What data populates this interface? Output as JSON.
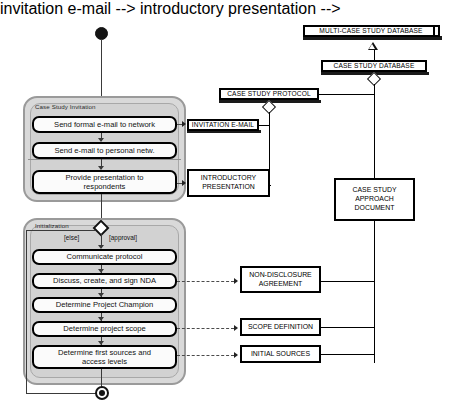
{
  "diagram": {
    "type": "uml-activity-diagram"
  },
  "control_nodes": {
    "start_label": "initial-node",
    "final_label": "activity-final-node",
    "decision_label": "decision-node"
  },
  "partitions": [
    {
      "id": "invitation",
      "label": "Case Study Invitation"
    },
    {
      "id": "initialization",
      "label": "Initialization"
    }
  ],
  "actions": [
    {
      "id": "a1",
      "label": "Send formal e-mail to network"
    },
    {
      "id": "a2",
      "label": "Send e-mail to personal netw."
    },
    {
      "id": "a3",
      "line1": "Provide presentation to",
      "line2": "respondents"
    },
    {
      "id": "a4",
      "label": "Communicate protocol"
    },
    {
      "id": "a5",
      "label": "Discuss, create, and sign NDA"
    },
    {
      "id": "a6",
      "label": "Determine Project Champion"
    },
    {
      "id": "a7",
      "label": "Determine project scope"
    },
    {
      "id": "a8",
      "line1": "Determine first sources and",
      "line2": "access levels"
    }
  ],
  "guards": {
    "else": "[else]",
    "approval": "[approval]"
  },
  "artifacts": {
    "multi_case_db": "MULTI-CASE STUDY DATABASE",
    "case_study_db": "CASE STUDY DATABASE",
    "case_study_protocol": "CASE STUDY PROTOCOL",
    "invitation_email": "INVITATION E-MAIL",
    "introductory_presentation_l1": "INTRODUCTORY",
    "introductory_presentation_l2": "PRESENTATION",
    "approach_document_l1": "CASE STUDY",
    "approach_document_l2": "APPROACH",
    "approach_document_l3": "DOCUMENT",
    "nda_l1": "NON-DISCLOSURE",
    "nda_l2": "AGREEMENT",
    "scope_definition": "SCOPE DEFINITION",
    "initial_sources": "INITIAL SOURCES"
  },
  "colors": {
    "partition_fill": "#d9d9d9",
    "partition_border": "#9a9a9a",
    "node_fill": "#fbfbfb",
    "node_border": "#000000",
    "connector": "#3a3a3a",
    "artifact_border": "#000000",
    "background": "#ffffff"
  }
}
